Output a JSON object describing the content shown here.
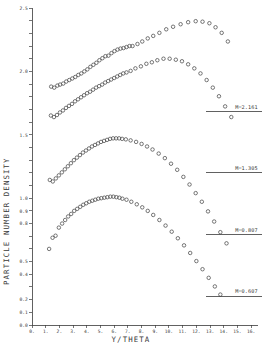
{
  "chart_data": {
    "type": "scatter",
    "title": "",
    "xlabel": "Y/THETA",
    "ylabel": "PARTICLE NUMBER DENSITY",
    "xlim": [
      0,
      16.5
    ],
    "ylim": [
      0.0,
      1.25
    ],
    "grid": false,
    "legend_position": "right-inline-annotations",
    "x_ticks": [
      "0.",
      "1.",
      "2.",
      "3.",
      "4.",
      "5.",
      "6.",
      "7.",
      "8.",
      "9.",
      "10.",
      "11.",
      "12.",
      "13.",
      "14.",
      "15.",
      "16."
    ],
    "x_tick_values": [
      0,
      1,
      2,
      3,
      4,
      5,
      6,
      7,
      8,
      9,
      10,
      11,
      12,
      13,
      14,
      15,
      16
    ],
    "y_ticks": [
      "0.0",
      "0.1",
      "0.2",
      "0.3",
      "0.4",
      "0.5",
      "0.6",
      "0.7",
      "0.8",
      "0.9",
      "1.0",
      "1.1",
      "1.2",
      "1.3",
      "1.4",
      "1.5",
      "1.6",
      "1.7",
      "1.8",
      "1.9",
      "2.0",
      "2.1",
      "2.2",
      "2.3",
      "2.4",
      "2.5"
    ],
    "y_tick_values": [
      0.0,
      0.05,
      0.1,
      0.15,
      0.2,
      0.25,
      0.3,
      0.35,
      0.4,
      0.45,
      0.5,
      0.55,
      0.6,
      0.65,
      0.7,
      0.75,
      0.8,
      0.85,
      0.9,
      0.95,
      1.0,
      1.05,
      1.1,
      1.15,
      1.2,
      1.25
    ],
    "y_major_labels": [
      {
        "value": 0.0,
        "text": "0.0"
      },
      {
        "value": 0.05,
        "text": "0.1"
      },
      {
        "value": 0.1,
        "text": "0.2"
      },
      {
        "value": 0.15,
        "text": "0.3"
      },
      {
        "value": 0.2,
        "text": "0.4"
      },
      {
        "value": 0.25,
        "text": "0.5"
      },
      {
        "value": 0.3,
        "text": "0.6"
      },
      {
        "value": 0.35,
        "text": "0.7"
      },
      {
        "value": 0.4,
        "text": "0.8"
      },
      {
        "value": 0.45,
        "text": "0.9"
      },
      {
        "value": 0.5,
        "text": "1.0"
      },
      {
        "value": 0.75,
        "text": "1.0"
      },
      {
        "value": 1.0,
        "text": "1.0"
      },
      {
        "value": 1.25,
        "text": "1.2"
      }
    ],
    "marker": "open-circle",
    "marker_color": "#4a4a4a",
    "series": [
      {
        "name": "M=2.161",
        "annotation": "M=2.161",
        "points": [
          [
            1.4,
            0.94
          ],
          [
            1.62,
            0.936
          ],
          [
            1.85,
            0.944
          ],
          [
            2.05,
            0.948
          ],
          [
            2.28,
            0.952
          ],
          [
            2.5,
            0.96
          ],
          [
            2.72,
            0.966
          ],
          [
            2.94,
            0.972
          ],
          [
            3.16,
            0.978
          ],
          [
            3.38,
            0.986
          ],
          [
            3.6,
            0.992
          ],
          [
            3.82,
            1.0
          ],
          [
            4.04,
            1.008
          ],
          [
            4.26,
            1.018
          ],
          [
            4.48,
            1.026
          ],
          [
            4.7,
            1.034
          ],
          [
            4.92,
            1.044
          ],
          [
            5.14,
            1.052
          ],
          [
            5.36,
            1.06
          ],
          [
            5.58,
            1.062
          ],
          [
            5.8,
            1.072
          ],
          [
            6.02,
            1.08
          ],
          [
            6.24,
            1.086
          ],
          [
            6.46,
            1.09
          ],
          [
            6.68,
            1.092
          ],
          [
            6.9,
            1.096
          ],
          [
            7.12,
            1.1
          ],
          [
            7.34,
            1.1
          ],
          [
            7.7,
            1.108
          ],
          [
            8.05,
            1.118
          ],
          [
            8.45,
            1.13
          ],
          [
            8.85,
            1.14
          ],
          [
            9.3,
            1.152
          ],
          [
            9.8,
            1.166
          ],
          [
            10.3,
            1.176
          ],
          [
            10.85,
            1.186
          ],
          [
            11.4,
            1.194
          ],
          [
            11.95,
            1.198
          ],
          [
            12.45,
            1.196
          ],
          [
            12.95,
            1.19
          ],
          [
            13.4,
            1.174
          ],
          [
            13.85,
            1.152
          ],
          [
            14.3,
            1.118
          ]
        ]
      },
      {
        "name": "M=1.305",
        "annotation": "M=1.305",
        "points": [
          [
            1.38,
            0.826
          ],
          [
            1.6,
            0.82
          ],
          [
            1.82,
            0.828
          ],
          [
            2.04,
            0.838
          ],
          [
            2.26,
            0.846
          ],
          [
            2.48,
            0.856
          ],
          [
            2.7,
            0.864
          ],
          [
            2.92,
            0.872
          ],
          [
            3.14,
            0.882
          ],
          [
            3.36,
            0.89
          ],
          [
            3.58,
            0.898
          ],
          [
            3.8,
            0.906
          ],
          [
            4.02,
            0.914
          ],
          [
            4.24,
            0.92
          ],
          [
            4.46,
            0.928
          ],
          [
            4.68,
            0.936
          ],
          [
            4.9,
            0.942
          ],
          [
            5.12,
            0.948
          ],
          [
            5.34,
            0.956
          ],
          [
            5.56,
            0.962
          ],
          [
            5.78,
            0.968
          ],
          [
            6.0,
            0.974
          ],
          [
            6.22,
            0.98
          ],
          [
            6.44,
            0.986
          ],
          [
            6.66,
            0.992
          ],
          [
            6.9,
            0.996
          ],
          [
            7.2,
            1.002
          ],
          [
            7.55,
            1.012
          ],
          [
            7.95,
            1.02
          ],
          [
            8.35,
            1.03
          ],
          [
            8.75,
            1.036
          ],
          [
            9.15,
            1.044
          ],
          [
            9.6,
            1.05
          ],
          [
            10.05,
            1.05
          ],
          [
            10.5,
            1.046
          ],
          [
            10.95,
            1.04
          ],
          [
            11.4,
            1.028
          ],
          [
            11.85,
            1.012
          ],
          [
            12.3,
            0.992
          ],
          [
            12.75,
            0.966
          ],
          [
            13.2,
            0.936
          ],
          [
            13.65,
            0.902
          ],
          [
            14.1,
            0.862
          ],
          [
            14.55,
            0.82
          ]
        ]
      },
      {
        "name": "M=0.807",
        "annotation": "M=0.807",
        "points": [
          [
            1.3,
            0.572
          ],
          [
            1.52,
            0.566
          ],
          [
            1.74,
            0.578
          ],
          [
            1.96,
            0.59
          ],
          [
            2.18,
            0.602
          ],
          [
            2.4,
            0.614
          ],
          [
            2.62,
            0.626
          ],
          [
            2.84,
            0.638
          ],
          [
            3.06,
            0.65
          ],
          [
            3.28,
            0.66
          ],
          [
            3.5,
            0.67
          ],
          [
            3.72,
            0.68
          ],
          [
            3.94,
            0.688
          ],
          [
            4.16,
            0.696
          ],
          [
            4.38,
            0.704
          ],
          [
            4.6,
            0.71
          ],
          [
            4.82,
            0.716
          ],
          [
            5.04,
            0.722
          ],
          [
            5.26,
            0.726
          ],
          [
            5.48,
            0.73
          ],
          [
            5.7,
            0.734
          ],
          [
            5.92,
            0.736
          ],
          [
            6.14,
            0.736
          ],
          [
            6.36,
            0.736
          ],
          [
            6.58,
            0.734
          ],
          [
            6.85,
            0.732
          ],
          [
            7.2,
            0.728
          ],
          [
            7.6,
            0.722
          ],
          [
            8.0,
            0.714
          ],
          [
            8.4,
            0.704
          ],
          [
            8.8,
            0.692
          ],
          [
            9.25,
            0.676
          ],
          [
            9.7,
            0.658
          ],
          [
            10.15,
            0.636
          ],
          [
            10.6,
            0.612
          ],
          [
            11.05,
            0.584
          ],
          [
            11.5,
            0.554
          ],
          [
            11.95,
            0.52
          ],
          [
            12.4,
            0.486
          ],
          [
            12.85,
            0.448
          ],
          [
            13.3,
            0.408
          ],
          [
            13.75,
            0.366
          ],
          [
            14.2,
            0.322
          ]
        ]
      },
      {
        "name": "M=0.607",
        "annotation": "M=0.607",
        "points": [
          [
            1.25,
            0.3
          ],
          [
            1.5,
            0.344
          ],
          [
            1.72,
            0.352
          ],
          [
            1.96,
            0.384
          ],
          [
            2.2,
            0.4
          ],
          [
            2.42,
            0.414
          ],
          [
            2.64,
            0.428
          ],
          [
            2.86,
            0.438
          ],
          [
            3.08,
            0.45
          ],
          [
            3.3,
            0.458
          ],
          [
            3.52,
            0.466
          ],
          [
            3.74,
            0.474
          ],
          [
            3.96,
            0.48
          ],
          [
            4.18,
            0.486
          ],
          [
            4.4,
            0.49
          ],
          [
            4.62,
            0.494
          ],
          [
            4.84,
            0.498
          ],
          [
            5.06,
            0.5
          ],
          [
            5.28,
            0.502
          ],
          [
            5.5,
            0.504
          ],
          [
            5.72,
            0.506
          ],
          [
            5.94,
            0.506
          ],
          [
            6.16,
            0.504
          ],
          [
            6.38,
            0.502
          ],
          [
            6.6,
            0.498
          ],
          [
            6.9,
            0.494
          ],
          [
            7.25,
            0.486
          ],
          [
            7.65,
            0.476
          ],
          [
            8.05,
            0.464
          ],
          [
            8.45,
            0.45
          ],
          [
            8.85,
            0.434
          ],
          [
            9.3,
            0.414
          ],
          [
            9.75,
            0.392
          ],
          [
            10.2,
            0.368
          ],
          [
            10.65,
            0.342
          ],
          [
            11.1,
            0.314
          ],
          [
            11.55,
            0.284
          ],
          [
            12.0,
            0.252
          ],
          [
            12.45,
            0.22
          ],
          [
            12.9,
            0.186
          ],
          [
            13.35,
            0.152
          ],
          [
            13.75,
            0.12
          ]
        ]
      }
    ],
    "annotations": [
      {
        "text": "M=2.161",
        "x": 14.05,
        "y": 0.845,
        "rule": true
      },
      {
        "text": "M=1.305",
        "x": 14.05,
        "y": 0.605,
        "rule": true
      },
      {
        "text": "M=0.807",
        "x": 14.05,
        "y": 0.36,
        "rule": true
      },
      {
        "text": "M=0.607",
        "x": 14.05,
        "y": 0.118,
        "rule": true
      }
    ]
  },
  "figure": {
    "background_color": "#ffffff",
    "axis_color": "#3a3a3a",
    "marker_stroke_color": "#4a4a4a"
  }
}
